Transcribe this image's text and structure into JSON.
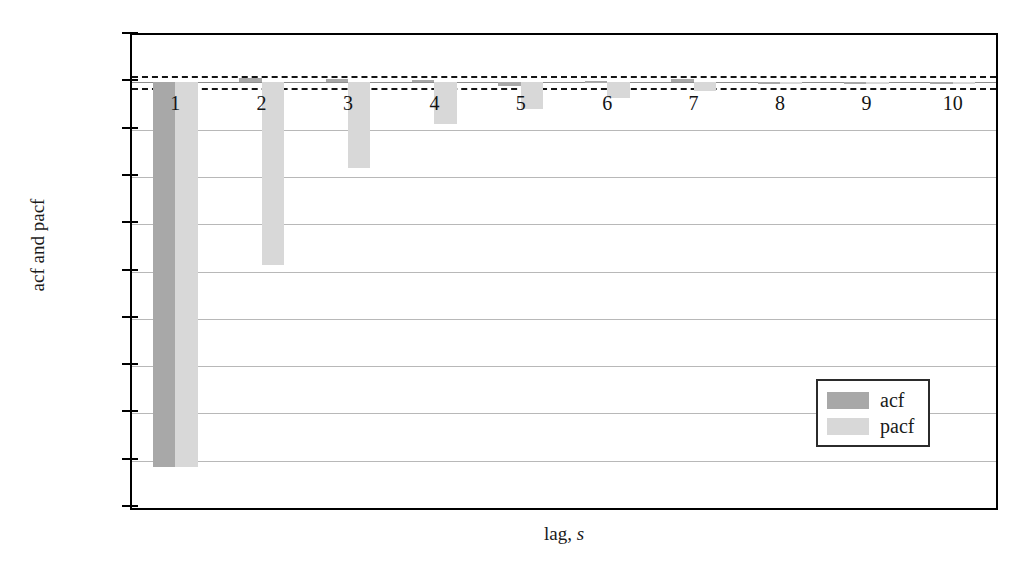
{
  "chart_data": {
    "type": "bar",
    "title": "",
    "subtitle": "",
    "xlabel": "lag, s",
    "xlabel_plain": "lag, ",
    "xlabel_italic": "s",
    "ylabel": "acf and pacf",
    "categories": [
      "1",
      "2",
      "3",
      "4",
      "5",
      "6",
      "7",
      "8",
      "9",
      "10"
    ],
    "xlim": [
      0.5,
      10.5
    ],
    "ylim": [
      -0.45,
      0.05
    ],
    "ytick_labels": [
      "0.05",
      "0",
      "−0.05",
      "−0.1",
      "−0.15",
      "−0.2",
      "−0.25",
      "−0.3",
      "−0.35",
      "−0.4",
      "−0.45"
    ],
    "ytick_values": [
      0.05,
      0,
      -0.05,
      -0.1,
      -0.15,
      -0.2,
      -0.25,
      -0.3,
      -0.35,
      -0.4,
      -0.45
    ],
    "grid": true,
    "grid_axis": "y",
    "legend_position": "lower right",
    "confidence_bands": [
      0.0065,
      -0.0065
    ],
    "series": [
      {
        "name": "acf",
        "color": "#a8a8a8",
        "values": [
          -0.407,
          0.005,
          0.004,
          0.002,
          -0.004,
          0.001,
          0.003,
          0.0,
          0.0,
          0.0
        ]
      },
      {
        "name": "pacf",
        "color": "#d8d8d8",
        "values": [
          -0.407,
          -0.193,
          -0.091,
          -0.044,
          -0.028,
          -0.017,
          -0.009,
          -0.002,
          -0.001,
          -0.001
        ]
      }
    ]
  },
  "legend": {
    "items": [
      {
        "label": "acf",
        "color": "#a8a8a8"
      },
      {
        "label": "pacf",
        "color": "#d8d8d8"
      }
    ]
  }
}
